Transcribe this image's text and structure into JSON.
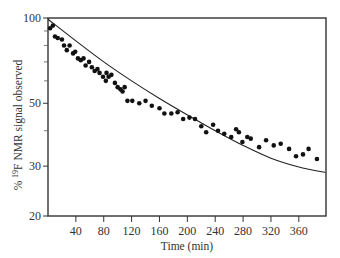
{
  "chart_data": {
    "type": "scatter",
    "title": "",
    "xlabel": "Time (min)",
    "ylabel": "% 19F NMR signal observed",
    "ylabel_parts": {
      "prefix": "% ",
      "sup": "19",
      "suffix": "F NMR signal observed"
    },
    "xlim": [
      0,
      399
    ],
    "ylim": [
      20,
      100
    ],
    "y_scale": "log",
    "x_ticks": [
      40,
      80,
      120,
      160,
      200,
      240,
      280,
      320,
      360
    ],
    "y_ticks_labeled": [
      100,
      50,
      30,
      20
    ],
    "y_ticks_minor": [
      90,
      80,
      70,
      60,
      40
    ],
    "grid": false,
    "legend": null,
    "fit_curve": {
      "description": "smooth decay fit through points",
      "points": [
        [
          0,
          99
        ],
        [
          40,
          83
        ],
        [
          80,
          70
        ],
        [
          120,
          60
        ],
        [
          160,
          52
        ],
        [
          200,
          45.5
        ],
        [
          240,
          40
        ],
        [
          280,
          35.5
        ],
        [
          320,
          32
        ],
        [
          360,
          29.8
        ],
        [
          398,
          28.5
        ]
      ]
    },
    "series": [
      {
        "name": "observed",
        "marker": "filled-circle",
        "color": "#111111",
        "points": [
          [
            3,
            92
          ],
          [
            7,
            94
          ],
          [
            10,
            86
          ],
          [
            14,
            85
          ],
          [
            20,
            84
          ],
          [
            23,
            80
          ],
          [
            27,
            77
          ],
          [
            31,
            80
          ],
          [
            36,
            75
          ],
          [
            39,
            76
          ],
          [
            43,
            72
          ],
          [
            47,
            71
          ],
          [
            51,
            72
          ],
          [
            54,
            68
          ],
          [
            59,
            70
          ],
          [
            63,
            67
          ],
          [
            67,
            65
          ],
          [
            71,
            66
          ],
          [
            74,
            64
          ],
          [
            79,
            62
          ],
          [
            83,
            60
          ],
          [
            84,
            64
          ],
          [
            87,
            62
          ],
          [
            91,
            63
          ],
          [
            96,
            59
          ],
          [
            100,
            57
          ],
          [
            104,
            56
          ],
          [
            107,
            55
          ],
          [
            110,
            57
          ],
          [
            114,
            51
          ],
          [
            121,
            51
          ],
          [
            131,
            50
          ],
          [
            140,
            51
          ],
          [
            149,
            49
          ],
          [
            160,
            48
          ],
          [
            167,
            46
          ],
          [
            177,
            46
          ],
          [
            186,
            46.5
          ],
          [
            194,
            44
          ],
          [
            203,
            44.5
          ],
          [
            211,
            44
          ],
          [
            220,
            41.5
          ],
          [
            227,
            39.5
          ],
          [
            237,
            42
          ],
          [
            244,
            40
          ],
          [
            253,
            39
          ],
          [
            263,
            38
          ],
          [
            270,
            40.5
          ],
          [
            274,
            39.5
          ],
          [
            279,
            36.5
          ],
          [
            286,
            38
          ],
          [
            291,
            37.5
          ],
          [
            303,
            35
          ],
          [
            313,
            37
          ],
          [
            324,
            35.5
          ],
          [
            334,
            36
          ],
          [
            346,
            34.5
          ],
          [
            356,
            32.5
          ],
          [
            366,
            33
          ],
          [
            374,
            34.5
          ],
          [
            386,
            31.8
          ]
        ]
      }
    ]
  }
}
